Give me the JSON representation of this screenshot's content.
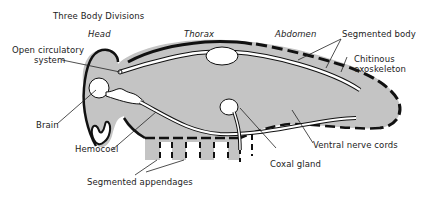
{
  "title": "Three Body Divisions",
  "divisions": {
    "head": "Head",
    "thorax": "Thorax",
    "abdomen": "Abdomen"
  },
  "labels": {
    "open_circulatory_line1": "Open circulatory",
    "open_circulatory_line2": "system",
    "segmented_body": "Segmented body",
    "chitinous_line1": "Chitinous",
    "chitinous_line2": "exoskeleton",
    "brain": "Brain",
    "hemocoel": "Hemocoel",
    "segmented_appendages": "Segmented appendages",
    "coxal_gland": "Coxal gland",
    "ventral_nerve_cords": "Ventral nerve cords"
  },
  "colors": {
    "body_fill": "#c4c4c4",
    "outline": "#111111",
    "organ_fill": "#ffffff",
    "text": "#222222"
  }
}
